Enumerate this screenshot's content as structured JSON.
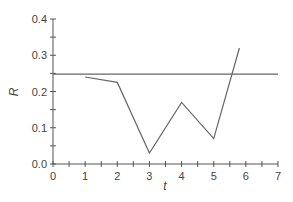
{
  "chart_data": {
    "type": "line",
    "title": "",
    "xlabel": "t",
    "ylabel": "R",
    "xlim": [
      0,
      7
    ],
    "ylim": [
      0,
      0.4
    ],
    "x_ticks": [
      "0",
      "1",
      "2",
      "3",
      "4",
      "5",
      "6",
      "7"
    ],
    "y_ticks": [
      "0.0",
      "0.1",
      "0.2",
      "0.3",
      "0.4"
    ],
    "grid": false,
    "legend": null,
    "series": [
      {
        "name": "R(t)",
        "x": [
          1,
          2,
          3,
          4,
          5,
          5.8
        ],
        "values": [
          0.24,
          0.225,
          0.03,
          0.17,
          0.07,
          0.32
        ]
      },
      {
        "name": "reference level",
        "x": [
          0,
          7
        ],
        "values": [
          0.248,
          0.248
        ]
      }
    ]
  },
  "colors": {
    "axis": "#555555",
    "line": "#666666",
    "text": "#444444"
  }
}
